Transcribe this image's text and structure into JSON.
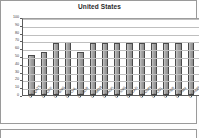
{
  "panel": {
    "title": "United States"
  },
  "chart_data": {
    "type": "bar",
    "title": "United States",
    "xlabel": "",
    "ylabel": "",
    "ylim": [
      0,
      100
    ],
    "yticks": [
      0,
      10,
      20,
      30,
      40,
      50,
      60,
      70,
      80,
      90,
      100
    ],
    "grid": true,
    "legend": "none",
    "categories": [
      "US-QATS",
      "US-OFF",
      "US-BNG",
      "US-CHL",
      "US-JOR",
      "US-MOR",
      "US-AUS",
      "US-SNG",
      "US-CAD",
      "US-OMN",
      "US-COL",
      "US-PER",
      "US-PAN",
      "US-KOR"
    ],
    "values": [
      51,
      55,
      67,
      68,
      55,
      67,
      67,
      67,
      67,
      67,
      67,
      67,
      67,
      68
    ],
    "bar_color": "#a6a6a6",
    "bar_edge_color": "#4a4a4a"
  },
  "axis": {
    "y_tick_labels": [
      "100",
      "90",
      "80",
      "70",
      "60",
      "50",
      "40",
      "30",
      "20",
      "10",
      "0"
    ]
  }
}
